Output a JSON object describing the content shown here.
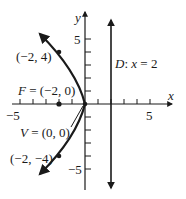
{
  "diagram": {
    "type": "parabola-graph",
    "equation_context": "Parabola with focus and directrix",
    "axes": {
      "x_label": "x",
      "y_label": "y",
      "x_ticks": {
        "min": -5,
        "max": 5,
        "labeled": [
          "-5",
          "5"
        ]
      },
      "y_ticks": {
        "min": -5,
        "max": 5,
        "labeled": [
          "5",
          "-5"
        ]
      }
    },
    "labels": {
      "x_neg5": "−5",
      "x_pos5": "5",
      "y_pos5": "5",
      "y_neg5": "−5",
      "x_axis": "x",
      "y_axis": "y",
      "point_top": "(−2, 4)",
      "point_bottom": "(−2, −4)",
      "focus": "F = (−2, 0)",
      "vertex": "V = (0, 0)",
      "directrix": "D: x = 2"
    },
    "points": [
      {
        "name": "top",
        "x": -2,
        "y": 4
      },
      {
        "name": "bottom",
        "x": -2,
        "y": -4
      },
      {
        "name": "focus",
        "x": -2,
        "y": 0
      },
      {
        "name": "vertex",
        "x": 0,
        "y": 0
      }
    ],
    "directrix_x": 2,
    "colors": {
      "ink": "#1a1a1a",
      "background": "#ffffff"
    }
  }
}
